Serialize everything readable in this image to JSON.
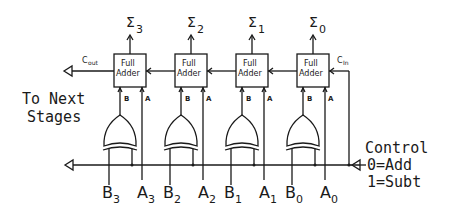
{
  "diagram": {
    "type": "4-bit adder/subtractor circuit",
    "stages": [
      {
        "index": 3,
        "block_label_line1": "Full",
        "block_label_line2": "Adder",
        "sum_symbol": "Σ",
        "sum_sub": "3",
        "b_label": "B",
        "b_sub": "3",
        "a_label": "A",
        "a_sub": "3",
        "pin_b": "B",
        "pin_a": "A"
      },
      {
        "index": 2,
        "block_label_line1": "Full",
        "block_label_line2": "Adder",
        "sum_symbol": "Σ",
        "sum_sub": "2",
        "b_label": "B",
        "b_sub": "2",
        "a_label": "A",
        "a_sub": "2",
        "pin_b": "B",
        "pin_a": "A"
      },
      {
        "index": 1,
        "block_label_line1": "Full",
        "block_label_line2": "Adder",
        "sum_symbol": "Σ",
        "sum_sub": "1",
        "b_label": "B",
        "b_sub": "1",
        "a_label": "A",
        "a_sub": "1",
        "pin_b": "B",
        "pin_a": "A"
      },
      {
        "index": 0,
        "block_label_line1": "Full",
        "block_label_line2": "Adder",
        "sum_symbol": "Σ",
        "sum_sub": "0",
        "b_label": "B",
        "b_sub": "0",
        "a_label": "A",
        "a_sub": "0",
        "pin_b": "B",
        "pin_a": "A"
      }
    ],
    "carry_out": {
      "main": "C",
      "sub": "out"
    },
    "carry_in": {
      "main": "C",
      "sub": "In"
    },
    "next_stages_label": {
      "line1": "To Next",
      "line2": "Stages"
    },
    "control": {
      "line1": "Control",
      "line2": "0=Add",
      "line3": "1=Subt"
    },
    "gate_type": "XOR",
    "colors": {
      "line": "#1a1a1a",
      "background": "#ffffff"
    }
  }
}
